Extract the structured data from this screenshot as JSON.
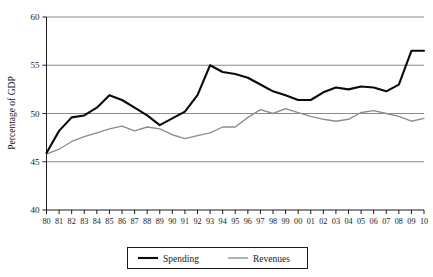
{
  "chart_data": {
    "type": "line",
    "title": "",
    "xlabel": "",
    "ylabel": "Percentage of GDP",
    "xlim": [
      1980,
      2010
    ],
    "ylim": [
      40,
      60
    ],
    "grid": true,
    "grid_axis": "y",
    "legend_position": "bottom-center",
    "x": [
      1980,
      1981,
      1982,
      1983,
      1984,
      1985,
      1986,
      1987,
      1988,
      1989,
      1990,
      1991,
      1992,
      1993,
      1994,
      1995,
      1996,
      1997,
      1998,
      1999,
      2000,
      2001,
      2002,
      2003,
      2004,
      2005,
      2006,
      2007,
      2008,
      2009,
      2010
    ],
    "categories": [
      "80",
      "81",
      "82",
      "83",
      "84",
      "85",
      "86",
      "87",
      "88",
      "89",
      "90",
      "91",
      "92",
      "93",
      "94",
      "95",
      "96",
      "97",
      "98",
      "99",
      "00",
      "01",
      "02",
      "03",
      "04",
      "05",
      "06",
      "07",
      "08",
      "09",
      "10"
    ],
    "xtick_labels": [
      "80",
      "81",
      "82",
      "83",
      "84",
      "85",
      "86",
      "87",
      "88",
      "89",
      "90",
      "91",
      "92",
      "93",
      "94",
      "95",
      "96",
      "97",
      "98",
      "99",
      "00",
      "01",
      "02",
      "03",
      "04",
      "05",
      "06",
      "07",
      "08",
      "09",
      "10"
    ],
    "ytick_labels": [
      "40",
      "45",
      "50",
      "55",
      "60"
    ],
    "ytick_values": [
      40,
      45,
      50,
      55,
      60
    ],
    "series": [
      {
        "name": "Spending",
        "color": "#0a0a0a",
        "values": [
          45.9,
          48.2,
          49.6,
          49.8,
          50.6,
          51.9,
          51.4,
          50.6,
          49.8,
          48.8,
          49.5,
          50.2,
          51.9,
          55.0,
          54.3,
          54.1,
          53.7,
          53.0,
          52.3,
          51.9,
          51.4,
          51.4,
          52.2,
          52.7,
          52.5,
          52.8,
          52.7,
          52.3,
          53.0,
          56.5,
          56.5
        ]
      },
      {
        "name": "Revenues",
        "color": "#8c8c8c",
        "values": [
          45.8,
          46.3,
          47.1,
          47.6,
          48.0,
          48.4,
          48.7,
          48.2,
          48.6,
          48.4,
          47.8,
          47.4,
          47.7,
          48.0,
          48.6,
          48.6,
          49.6,
          50.4,
          50.0,
          50.5,
          50.1,
          49.7,
          49.4,
          49.2,
          49.4,
          50.1,
          50.3,
          50.0,
          49.7,
          49.2,
          49.5
        ]
      }
    ]
  },
  "legend": {
    "entries": [
      {
        "label": "Spending"
      },
      {
        "label": "Revenues"
      }
    ]
  },
  "axes": {
    "y_title": "Percentage of GDP"
  }
}
